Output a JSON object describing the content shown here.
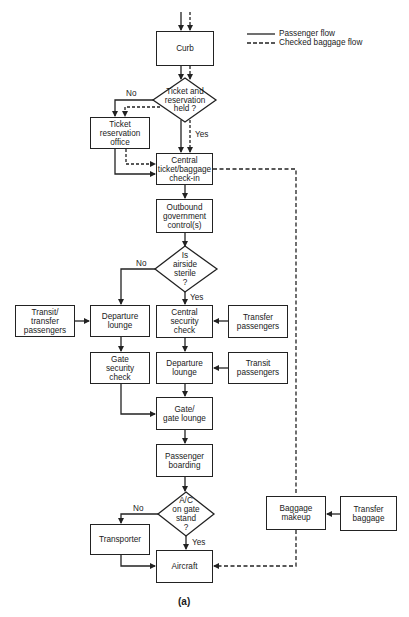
{
  "legend": {
    "passenger_flow": "Passenger flow",
    "checked_baggage_flow": "Checked baggage flow"
  },
  "nodes": {
    "curb": "Curb",
    "ticket_decision": "Ticket and\nreservation\nheld ?",
    "ticket_office": "Ticket\nreservation\noffice",
    "central_checkin": "Central\nticket/baggage\ncheck-in",
    "outbound_control": "Outbound\ngovernment\ncontrol(s)",
    "airside_decision": "Is\nairside\nsterile\n?",
    "transit_transfer_passengers": "Transit/\ntransfer\npassengers",
    "departure_lounge_left": "Departure\nlounge",
    "central_security": "Central\nsecurity\ncheck",
    "transfer_passengers": "Transfer\npassengers",
    "gate_security": "Gate\nsecurity\ncheck",
    "departure_lounge_right": "Departure\nlounge",
    "transit_passengers": "Transit\npassengers",
    "gate_lounge": "Gate/\ngate lounge",
    "passenger_boarding": "Passenger\nboarding",
    "ac_decision": "A/C\non gate\nstand\n?",
    "transporter": "Transporter",
    "aircraft": "Aircraft",
    "baggage_makeup": "Baggage\nmakeup",
    "transfer_baggage": "Transfer\nbaggage"
  },
  "edge_labels": {
    "ticket_no": "No",
    "ticket_yes": "Yes",
    "airside_no": "No",
    "airside_yes": "Yes",
    "ac_no": "No",
    "ac_yes": "Yes"
  },
  "caption": "(a)",
  "colors": {
    "line": "#222222",
    "background": "#ffffff"
  }
}
